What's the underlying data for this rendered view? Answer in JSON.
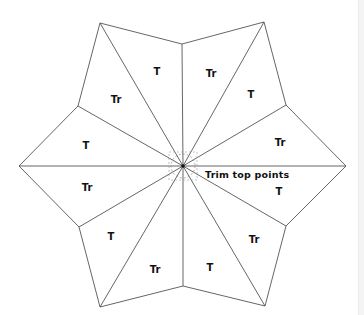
{
  "diagram": {
    "type": "six-point star quilt pattern",
    "stroke_color": "#555555",
    "center": [
      183,
      166
    ],
    "outer_tips": [
      [
        100,
        23
      ],
      [
        264,
        22
      ],
      [
        346,
        166
      ],
      [
        265,
        306
      ],
      [
        100,
        307
      ],
      [
        19,
        166
      ]
    ],
    "inner_vertices": [
      [
        182,
        44
      ],
      [
        286,
        105
      ],
      [
        286,
        226
      ],
      [
        183,
        286
      ],
      [
        79,
        227
      ],
      [
        78,
        106
      ]
    ],
    "labels": [
      {
        "text": "T",
        "x": 157,
        "y": 75
      },
      {
        "text": "Tr",
        "x": 211,
        "y": 77
      },
      {
        "text": "T",
        "x": 251,
        "y": 98
      },
      {
        "text": "Tr",
        "x": 280,
        "y": 146
      },
      {
        "text": "T",
        "x": 279,
        "y": 195
      },
      {
        "text": "Tr",
        "x": 254,
        "y": 243
      },
      {
        "text": "T",
        "x": 210,
        "y": 271
      },
      {
        "text": "Tr",
        "x": 155,
        "y": 273
      },
      {
        "text": "T",
        "x": 111,
        "y": 240
      },
      {
        "text": "Tr",
        "x": 87,
        "y": 191
      },
      {
        "text": "T",
        "x": 86,
        "y": 149
      },
      {
        "text": "Tr",
        "x": 116,
        "y": 103
      }
    ],
    "annotation": {
      "text": "Trim top points",
      "x": 205,
      "y": 178
    }
  }
}
